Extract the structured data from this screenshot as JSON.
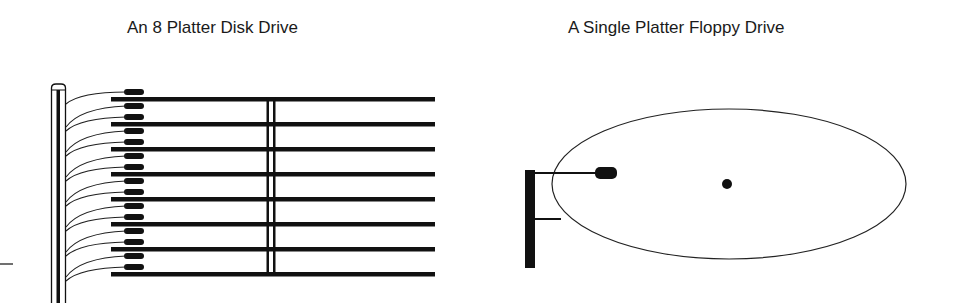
{
  "diagrams": [
    {
      "title": "An 8 Platter Disk Drive",
      "platter_count": 8,
      "head_count": 16,
      "components": [
        "platters",
        "spindle",
        "read-write-heads",
        "actuator-arms",
        "actuator-post"
      ]
    },
    {
      "title": "A Single Platter Floppy Drive",
      "platter_count": 1,
      "head_count": 1,
      "components": [
        "platter",
        "spindle",
        "read-write-head",
        "actuator-arm",
        "actuator-post"
      ]
    }
  ],
  "colors": {
    "ink": "#111111",
    "background": "#ffffff"
  }
}
